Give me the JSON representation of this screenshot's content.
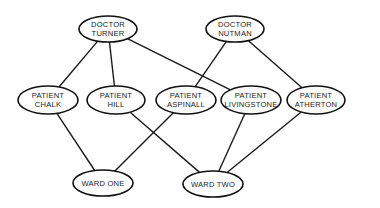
{
  "diagram": {
    "nodes": [
      {
        "id": "turner",
        "lines": [
          "DOCTOR",
          "TURNER"
        ],
        "cx": 108,
        "cy": 29,
        "rx": 29,
        "ry": 13
      },
      {
        "id": "nutman",
        "lines": [
          "DOCTOR",
          "NUTMAN"
        ],
        "cx": 235,
        "cy": 29,
        "rx": 29,
        "ry": 13
      },
      {
        "id": "chalk",
        "lines": [
          "PATIENT",
          "CHALK"
        ],
        "cx": 48,
        "cy": 100,
        "rx": 30,
        "ry": 14
      },
      {
        "id": "hill",
        "lines": [
          "PATIENT",
          "HILL"
        ],
        "cx": 116,
        "cy": 100,
        "rx": 29,
        "ry": 14
      },
      {
        "id": "aspinall",
        "lines": [
          "PATIENT",
          "ASPINALL"
        ],
        "cx": 186,
        "cy": 100,
        "rx": 30,
        "ry": 14
      },
      {
        "id": "livingstone",
        "lines": [
          "PATIENT",
          "LIVINGSTONE"
        ],
        "cx": 251,
        "cy": 100,
        "rx": 30,
        "ry": 14
      },
      {
        "id": "atherton",
        "lines": [
          "PATIENT",
          "ATHERTON"
        ],
        "cx": 316,
        "cy": 100,
        "rx": 29,
        "ry": 14
      },
      {
        "id": "wardone",
        "lines": [
          "WARD ONE"
        ],
        "cx": 103,
        "cy": 183,
        "rx": 30,
        "ry": 13
      },
      {
        "id": "wardtwo",
        "lines": [
          "WARD TWO"
        ],
        "cx": 213,
        "cy": 184,
        "rx": 30,
        "ry": 13
      }
    ],
    "edges": [
      {
        "from": "turner",
        "to": "chalk"
      },
      {
        "from": "turner",
        "to": "hill"
      },
      {
        "from": "turner",
        "to": "livingstone"
      },
      {
        "from": "nutman",
        "to": "aspinall"
      },
      {
        "from": "nutman",
        "to": "atherton"
      },
      {
        "from": "chalk",
        "to": "wardone"
      },
      {
        "from": "aspinall",
        "to": "wardone"
      },
      {
        "from": "hill",
        "to": "wardtwo"
      },
      {
        "from": "livingstone",
        "to": "wardtwo"
      },
      {
        "from": "atherton",
        "to": "wardtwo"
      }
    ]
  }
}
